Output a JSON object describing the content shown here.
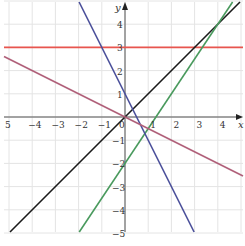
{
  "chart_data": {
    "type": "line",
    "title": "",
    "xlabel": "x",
    "ylabel": "y",
    "xlim": [
      -5,
      5
    ],
    "ylim": [
      -5,
      5
    ],
    "grid": true,
    "x_ticks": [
      "5",
      "−4",
      "−3",
      "−2",
      "−1",
      "0",
      "1",
      "2",
      "3",
      "4"
    ],
    "x_tick_values": [
      -5,
      -4,
      -3,
      -2,
      -1,
      0,
      1,
      2,
      3,
      4
    ],
    "y_ticks": [
      "4",
      "3",
      "2",
      "1",
      "−1",
      "−2",
      "−3",
      "−4",
      "−5"
    ],
    "y_tick_values": [
      4,
      3,
      2,
      1,
      -1,
      -2,
      -3,
      -4,
      -5
    ],
    "series": [
      {
        "name": "y = 3",
        "color": "#e8554e",
        "slope": 0,
        "intercept": 3
      },
      {
        "name": "y = x",
        "color": "#1a1a1a",
        "slope": 1,
        "intercept": 0
      },
      {
        "name": "y = 1.5x - 2",
        "color": "#4a9a5e",
        "slope": 1.5,
        "intercept": -2
      },
      {
        "name": "y = -2x + 1",
        "color": "#4a4f9a",
        "slope": -2,
        "intercept": 1
      },
      {
        "name": "y = -0.5x",
        "color": "#b0607a",
        "slope": -0.5,
        "intercept": 0
      }
    ]
  }
}
